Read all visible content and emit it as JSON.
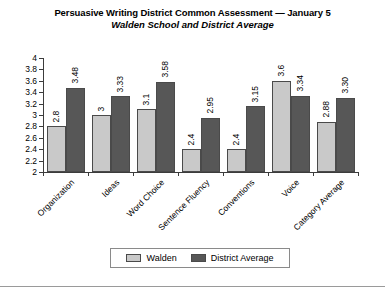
{
  "chart_data": {
    "type": "bar",
    "title": "Persuasive Writing District Common Assessment — January 5",
    "subtitle": "Walden School and District Average",
    "xlabel": "",
    "ylabel": "",
    "ylim": [
      2,
      4
    ],
    "ytick_step": 0.2,
    "yticks": [
      "4",
      "3.8",
      "3.6",
      "3.4",
      "3.2",
      "3",
      "2.8",
      "2.6",
      "2.4",
      "2.2",
      "2"
    ],
    "grid": false,
    "legend_position": "bottom",
    "categories": [
      "Organization",
      "Ideas",
      "Word Choice",
      "Sentence Fluency",
      "Conventions",
      "Voice",
      "Category Average"
    ],
    "series": [
      {
        "name": "Walden",
        "color": "#c9c9c9",
        "values": [
          2.8,
          3,
          3.1,
          2.4,
          2.4,
          3.6,
          2.88
        ],
        "labels": [
          "2.8",
          "3",
          "3.1",
          "2.4",
          "2.4",
          "3.6",
          "2.88"
        ]
      },
      {
        "name": "District Average",
        "color": "#575757",
        "values": [
          3.48,
          3.33,
          3.58,
          2.95,
          3.15,
          3.34,
          3.3
        ],
        "labels": [
          "3.48",
          "3.33",
          "3.58",
          "2.95",
          "3.15",
          "3.34",
          "3.30"
        ]
      }
    ]
  },
  "legend": {
    "items": [
      {
        "label": "Walden"
      },
      {
        "label": "District Average"
      }
    ]
  }
}
